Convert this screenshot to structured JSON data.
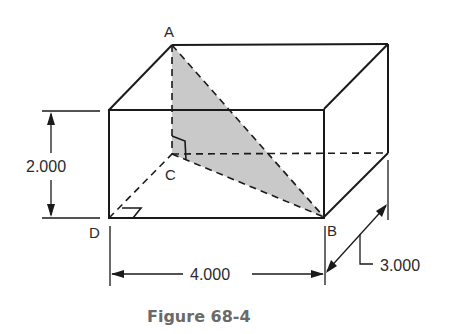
{
  "figure": {
    "caption": "Figure 68-4",
    "shape": "rectangular box (right rectangular prism)",
    "shaded_region": "triangle ABC",
    "colors": {
      "line": "#1a1a1a",
      "shade": "#c9c9c9",
      "caption": "#6a6a6a"
    }
  },
  "points": {
    "A": "A",
    "B": "B",
    "C": "C",
    "D": "D"
  },
  "dimensions": {
    "height": "2.000",
    "width": "4.000",
    "depth": "3.000"
  },
  "annotations": {
    "right_angle_at_C": true,
    "right_angle_at_D": true
  }
}
